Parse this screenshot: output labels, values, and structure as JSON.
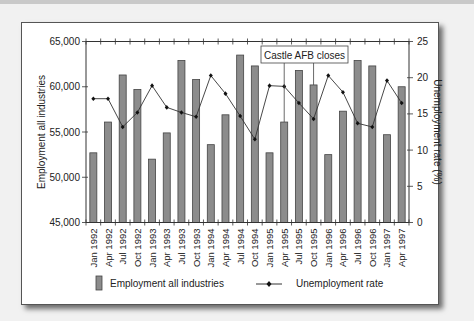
{
  "chart_data": {
    "type": "bar",
    "title": "",
    "annotation": "Castle AFB closes",
    "categories": [
      "Jan 1992",
      "Apr 1992",
      "Jul 1992",
      "Oct 1992",
      "Jan 1993",
      "Apr 1993",
      "Jul 1993",
      "Oct 1993",
      "Jan 1994",
      "Apr 1994",
      "Jul 1994",
      "Oct 1994",
      "Jan 1995",
      "Apr 1995",
      "Jul 1995",
      "Oct 1995",
      "Jan 1996",
      "Apr 1996",
      "Jul 1996",
      "Oct 1996",
      "Jan 1997",
      "Apr 1997"
    ],
    "series": [
      {
        "name": "Employment all industries",
        "type": "bar",
        "axis": "left",
        "color": "#8c8c8c",
        "values": [
          52700,
          56100,
          61300,
          59700,
          52000,
          54900,
          62900,
          60800,
          53600,
          56900,
          63500,
          62300,
          52700,
          56100,
          61800,
          60200,
          52500,
          57300,
          62900,
          62300,
          54700,
          60000
        ]
      },
      {
        "name": "Unemployment rate",
        "type": "line",
        "axis": "right",
        "color": "#333333",
        "values": [
          17.1,
          17.1,
          13.2,
          15.2,
          18.9,
          15.9,
          15.2,
          14.6,
          20.3,
          17.8,
          14.7,
          11.5,
          18.9,
          18.8,
          16.5,
          14.3,
          20.3,
          18.0,
          13.7,
          13.2,
          19.6,
          16.5
        ]
      }
    ],
    "xlabel": "",
    "ylabel": "Employment all industries",
    "ylabel_right": "Unemployment rate (%)",
    "ylim": [
      45000,
      65000
    ],
    "ylim_right": [
      0,
      25
    ],
    "yticks": [
      "45,000",
      "50,000",
      "55,000",
      "60,000",
      "65,000"
    ],
    "yticks_right": [
      "0",
      "5",
      "10",
      "15",
      "20",
      "25"
    ],
    "annotation_categories": [
      "Apr 1995",
      "Oct 1995"
    ],
    "grid": false,
    "legend_position": "bottom"
  },
  "legend": {
    "bar_label": "Employment all industries",
    "line_label": "Unemployment rate"
  }
}
